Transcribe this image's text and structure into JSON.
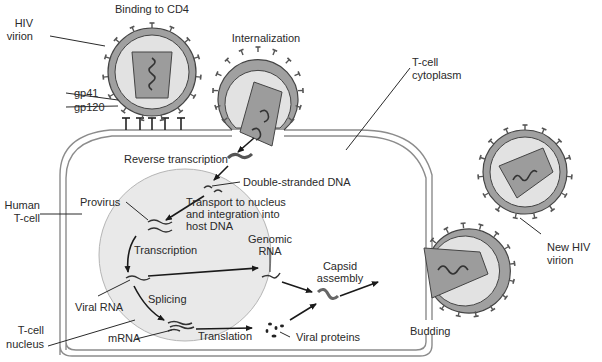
{
  "diagram": {
    "colors": {
      "cell_fill": "#ffffff",
      "membrane": "#9a9a9a",
      "nucleus_fill": "#eaeaea",
      "virion_envelope": "#a0a0a0",
      "virion_interior": "#e4e4e4",
      "capsid": "#9c9c9c",
      "text": "#2a2a2a"
    },
    "labels": {
      "hiv_virion": [
        "HIV",
        "virion"
      ],
      "binding": "Binding to CD4",
      "gp41": "gp41",
      "gp120": "gp120",
      "internalization": "Internalization",
      "tcell_cytoplasm": [
        "T-cell",
        "cytoplasm"
      ],
      "reverse_transcription": "Reverse transcription",
      "double_stranded_dna": "Double-stranded DNA",
      "provirus": "Provirus",
      "transport": [
        "Transport to nucleus",
        "and integration into",
        "host DNA"
      ],
      "human_tcell": [
        "Human",
        "T-cell"
      ],
      "transcription": "Transcription",
      "genomic_rna": [
        "Genomic",
        "RNA"
      ],
      "capsid_assembly": [
        "Capsid",
        "assembly"
      ],
      "viral_rna": "Viral RNA",
      "splicing": "Splicing",
      "tcell_nucleus": [
        "T-cell",
        "nucleus"
      ],
      "mrna": "mRNA",
      "translation": "Translation",
      "viral_proteins": "Viral proteins",
      "budding": "Budding",
      "new_hiv_virion": [
        "New HIV",
        "virion"
      ]
    }
  }
}
